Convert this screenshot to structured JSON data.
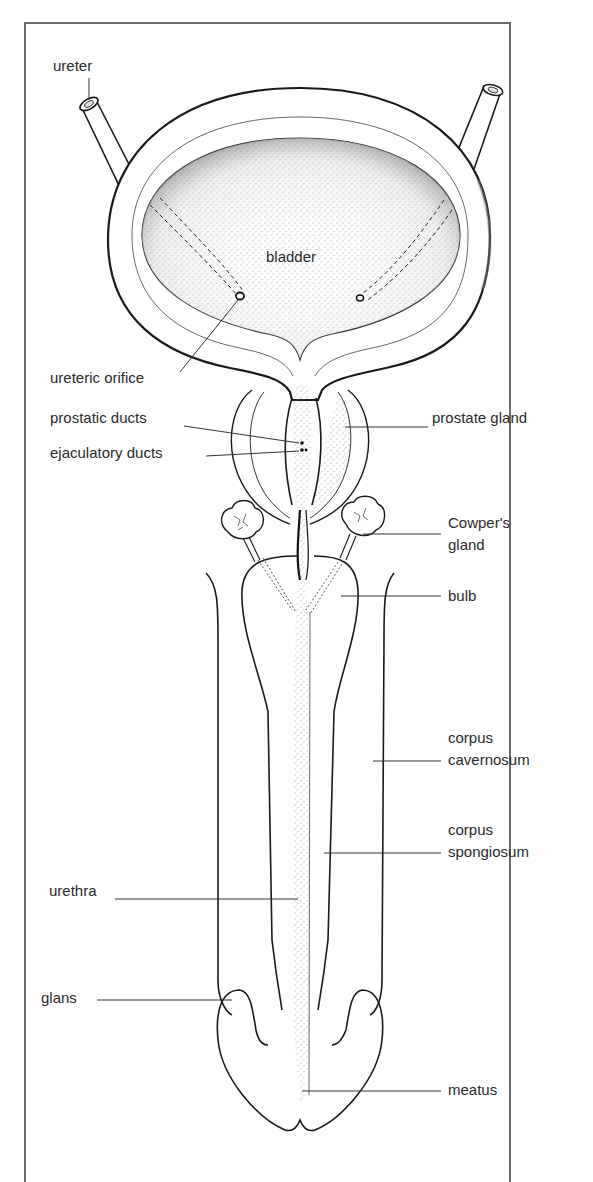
{
  "figure": {
    "frame_color": "#6a6a6a",
    "line_color": "#1a1a1a",
    "stipple_color": "#9a9a9a"
  },
  "labels": {
    "ureter": "ureter",
    "bladder": "bladder",
    "ureteric_orifice": "ureteric orifice",
    "prostatic_ducts": "prostatic ducts",
    "ejaculatory_ducts": "ejaculatory ducts",
    "prostate_gland": "prostate gland",
    "cowpers_gland_1": "Cowper's",
    "cowpers_gland_2": "gland",
    "bulb": "bulb",
    "corpus_cavernosum_1": "corpus",
    "corpus_cavernosum_2": "cavernosum",
    "corpus_spongiosum_1": "corpus",
    "corpus_spongiosum_2": "spongiosum",
    "urethra": "urethra",
    "glans": "glans",
    "meatus": "meatus"
  }
}
